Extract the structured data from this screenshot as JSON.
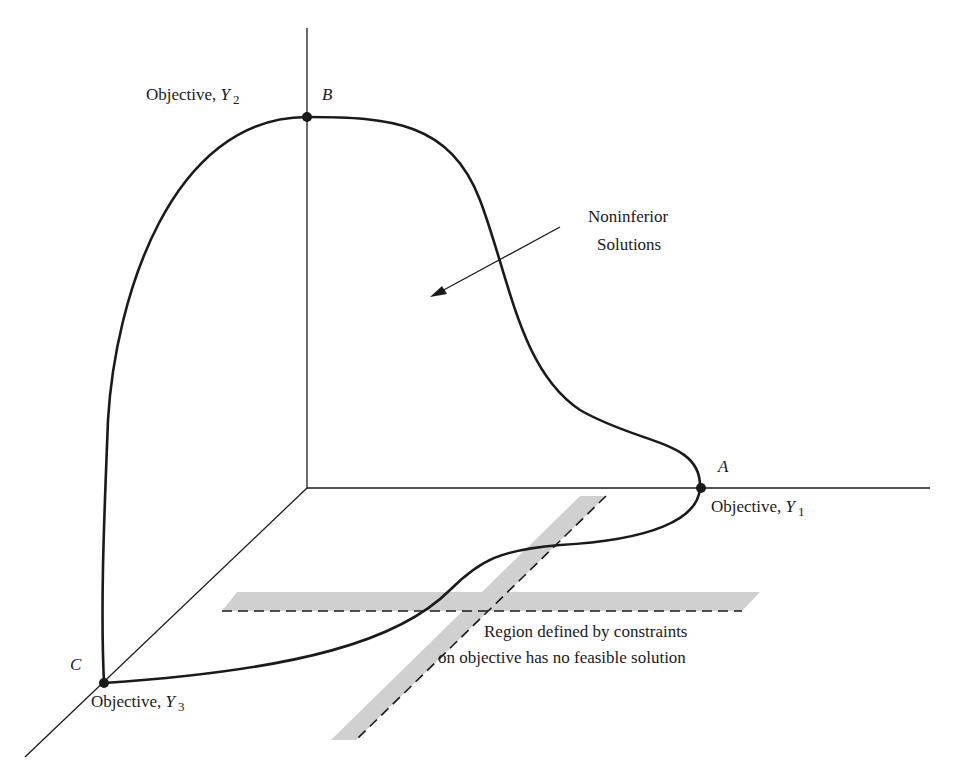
{
  "figure": {
    "type": "3d-objective-space-diagram",
    "axes": {
      "y1": {
        "label": "Objective, ",
        "var": "Y",
        "sub": "1"
      },
      "y2": {
        "label": "Objective, ",
        "var": "Y",
        "sub": "2"
      },
      "y3": {
        "label": "Objective, ",
        "var": "Y",
        "sub": "3"
      }
    },
    "points": {
      "A": "A",
      "B": "B",
      "C": "C"
    },
    "annotations": {
      "noninferior_line1": "Noninferior",
      "noninferior_line2": "Solutions",
      "region_line1": "Region defined by constraints",
      "region_line2": "on objective has no feasible solution"
    },
    "colors": {
      "ink": "#1a1a1a",
      "band": "#d0d0d0",
      "background": "#ffffff"
    }
  }
}
